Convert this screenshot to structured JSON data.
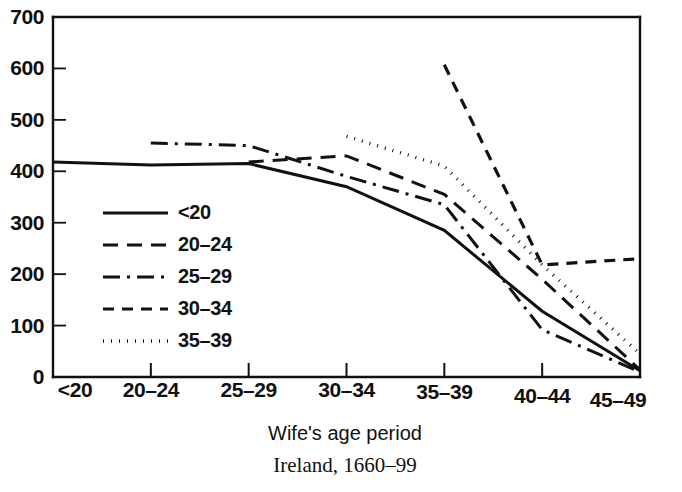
{
  "chart_data": {
    "type": "line",
    "title": "",
    "subtitle": "",
    "xlabel": "Wife's age period",
    "ylabel": "",
    "caption": "Ireland, 1660–99",
    "categories": [
      "<20",
      "20–24",
      "25–29",
      "30–34",
      "35–39",
      "40–44",
      "45–49"
    ],
    "ylim": [
      0,
      700
    ],
    "yticks": [
      0,
      100,
      200,
      300,
      400,
      500,
      600,
      700
    ],
    "ytick_labels": [
      "0",
      "100",
      "200",
      "300",
      "400",
      "500",
      "600",
      "700"
    ],
    "grid": false,
    "legend_position": "inside-left",
    "series": [
      {
        "name": "<20",
        "dash": "solid",
        "stroke_width": 3.0,
        "dasharray": "none",
        "values": [
          418,
          412,
          415,
          370,
          285,
          128,
          12
        ]
      },
      {
        "name": "20–24",
        "dash": "long-dash",
        "stroke_width": 3.0,
        "dasharray": "15,9",
        "values": [
          null,
          null,
          418,
          430,
          355,
          190,
          14
        ]
      },
      {
        "name": "25–29",
        "dash": "dash-dot",
        "stroke_width": 3.0,
        "dasharray": "17,7,3,7",
        "values": [
          null,
          455,
          450,
          390,
          335,
          92,
          10
        ]
      },
      {
        "name": "30–34",
        "dash": "short-dash",
        "stroke_width": 3.2,
        "dasharray": "11,8",
        "values": [
          null,
          null,
          null,
          null,
          607,
          218,
          230
        ]
      },
      {
        "name": "35–39",
        "dash": "dotted",
        "stroke_width": 3.4,
        "dasharray": "1,7",
        "values": [
          null,
          null,
          null,
          468,
          410,
          218,
          45
        ]
      }
    ],
    "legend_entries": [
      {
        "label": "<20",
        "dasharray": "none",
        "stroke_width": 3.0
      },
      {
        "label": "20–24",
        "dasharray": "15,9",
        "stroke_width": 3.2
      },
      {
        "label": "25–29",
        "dasharray": "17,7,3,7",
        "stroke_width": 3.2
      },
      {
        "label": "30–34",
        "dasharray": "11,8",
        "stroke_width": 3.2
      },
      {
        "label": "35–39",
        "dasharray": "1,7",
        "stroke_width": 3.6
      }
    ],
    "colors": {
      "ink": "#111111",
      "background": "#ffffff"
    }
  }
}
